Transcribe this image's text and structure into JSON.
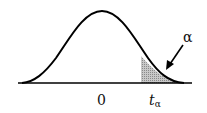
{
  "diagram": {
    "curve": "bell-shaped density",
    "labels": {
      "center": "0",
      "critical_value_main": "t",
      "critical_value_sub": "α",
      "tail_area": "α"
    },
    "colors": {
      "curve": "#000000",
      "shade": "#a8a8a8",
      "background": "#ffffff"
    }
  }
}
